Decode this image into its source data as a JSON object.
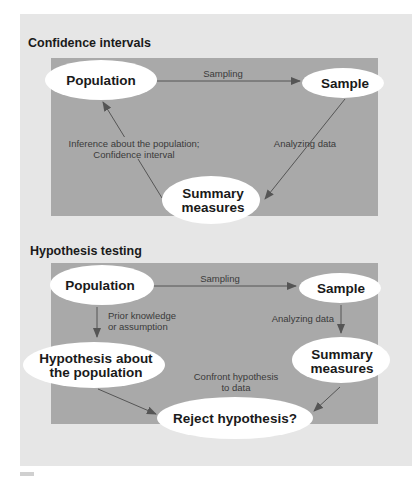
{
  "colors": {
    "outer_panel": "#e6e6e6",
    "inner_box": "#a9a9a9",
    "node_fill": "#ffffff",
    "node_text": "#1a1a1a",
    "edge": "#555555",
    "edge_label": "#3a3a3a"
  },
  "confidence_intervals": {
    "title": "Confidence intervals",
    "nodes": {
      "population": "Population",
      "sample": "Sample",
      "summary_line1": "Summary",
      "summary_line2": "measures"
    },
    "edges": {
      "sampling": "Sampling",
      "analyzing": "Analyzing data",
      "inference_line1": "Inference about the population;",
      "inference_line2": "Confidence interval"
    }
  },
  "hypothesis_testing": {
    "title": "Hypothesis testing",
    "nodes": {
      "population": "Population",
      "sample": "Sample",
      "hypothesis_line1": "Hypothesis about",
      "hypothesis_line2": "the population",
      "summary_line1": "Summary",
      "summary_line2": "measures",
      "reject": "Reject hypothesis?"
    },
    "edges": {
      "sampling": "Sampling",
      "prior_line1": "Prior knowledge",
      "prior_line2": "or assumption",
      "analyzing": "Analyzing data",
      "confront_line1": "Confront hypothesis",
      "confront_line2": "to data"
    }
  }
}
